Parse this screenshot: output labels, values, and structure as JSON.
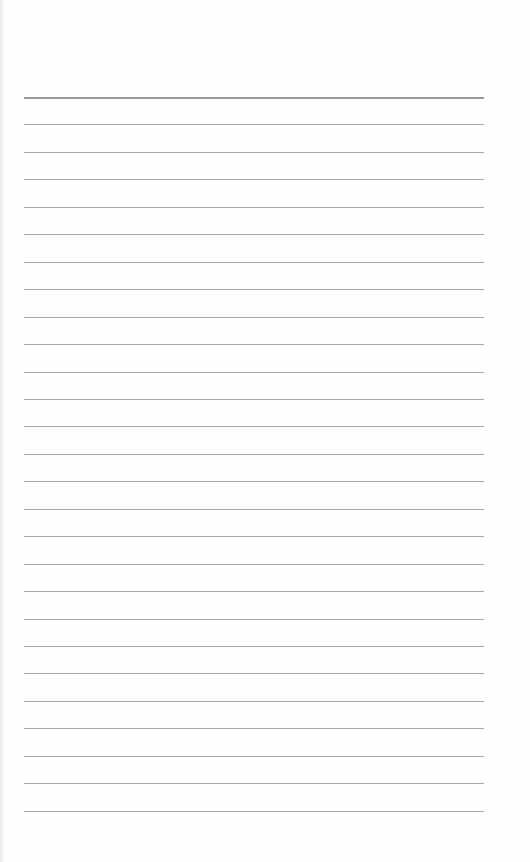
{
  "page": {
    "type": "lined-paper",
    "background_color": "#fefefe",
    "line_color": "#a9a9a9",
    "line_count": 27,
    "first_line_y": 97,
    "line_spacing": 27.45,
    "line_left": 24,
    "line_width": 460
  }
}
